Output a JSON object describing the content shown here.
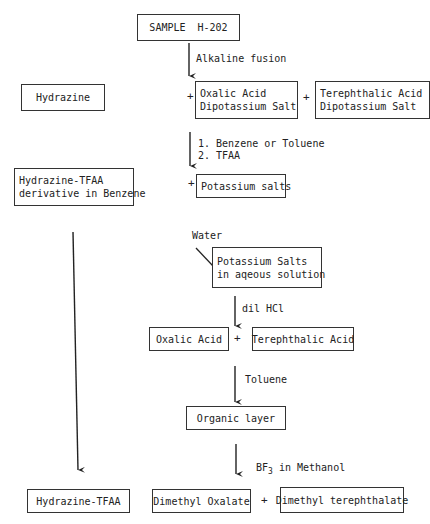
{
  "diagram": {
    "type": "process-flowchart",
    "nodes": {
      "sample": "SAMPLE  H-202",
      "hydrazine": "Hydrazine",
      "oxalic_salt": "Oxalic Acid\nDipotassium Salt",
      "terephthalic_salt": "Terephthalic Acid\nDipotassium Salt",
      "hydrazine_tfaa_deriv": "Hydrazine-TFAA\nderivative in Benzene",
      "potassium_salts": "Potassium salts",
      "potassium_salts_aq": "Potassium Salts\nin aqeous solution",
      "oxalic_acid": "Oxalic Acid",
      "terephthalic_acid": "Terephthalic Acid",
      "organic_layer": "Organic layer",
      "hydrazine_tfaa": "Hydrazine-TFAA",
      "dimethyl_oxalate": "Dimethyl Oxalate",
      "dimethyl_terephthalate": "Dimethyl terephthalate"
    },
    "steps": {
      "alkaline_fusion": "Alkaline fusion",
      "solvents": "1. Benzene or Toluene\n2. TFAA",
      "water": "Water",
      "dil_hcl": "dil HCl",
      "toluene": "Toluene",
      "bf3_prefix": "BF",
      "bf3_sub": "3",
      "bf3_suffix": " in Methanol"
    },
    "plus": "+"
  }
}
